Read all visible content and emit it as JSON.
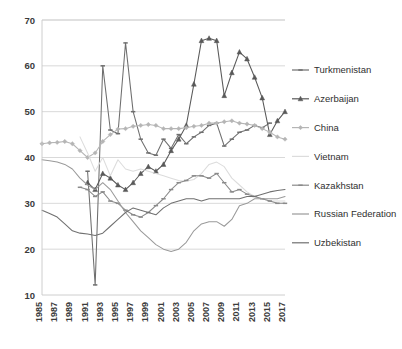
{
  "chart_data": {
    "type": "line",
    "title": "",
    "xlabel": "",
    "ylabel": "",
    "grid": true,
    "legend_position": "right",
    "xlim": [
      1985,
      2017
    ],
    "ylim": [
      10,
      70
    ],
    "y_ticks": [
      10,
      20,
      30,
      40,
      50,
      60,
      70
    ],
    "x_ticks": [
      1985,
      1987,
      1989,
      1991,
      1993,
      1995,
      1997,
      1999,
      2001,
      2003,
      2005,
      2007,
      2009,
      2011,
      2013,
      2015,
      2017
    ],
    "x": [
      1985,
      1986,
      1987,
      1988,
      1989,
      1990,
      1991,
      1992,
      1993,
      1994,
      1995,
      1996,
      1997,
      1998,
      1999,
      2000,
      2001,
      2002,
      2003,
      2004,
      2005,
      2006,
      2007,
      2008,
      2009,
      2010,
      2011,
      2012,
      2013,
      2014,
      2015,
      2016,
      2017
    ],
    "series": [
      {
        "name": "Turkmenistan",
        "color": "#6e6e6e",
        "marker": "dash",
        "values": [
          null,
          null,
          null,
          null,
          null,
          null,
          37.0,
          12.2,
          60.0,
          46.0,
          45.2,
          65.0,
          50.0,
          44.0,
          41.0,
          40.5,
          44.0,
          42.0,
          45.0,
          43.0,
          44.5,
          45.5,
          47.0,
          47.5,
          42.5,
          44.0,
          45.5,
          46.0,
          47.0,
          46.5,
          47.5,
          null,
          null
        ]
      },
      {
        "name": "Azerbaijan",
        "color": "#595959",
        "marker": "triangle",
        "values": [
          null,
          null,
          null,
          null,
          null,
          null,
          34.5,
          33.0,
          36.5,
          35.5,
          34.0,
          33.0,
          34.5,
          36.5,
          38.0,
          37.0,
          38.5,
          41.5,
          44.0,
          47.0,
          56.0,
          65.5,
          66.0,
          65.5,
          53.5,
          58.5,
          63.0,
          61.5,
          57.5,
          53.0,
          45.0,
          48.0,
          50.0
        ]
      },
      {
        "name": "China",
        "color": "#b5b5b5",
        "marker": "diamond",
        "values": [
          43.0,
          43.2,
          43.3,
          43.5,
          43.0,
          41.5,
          40.0,
          41.0,
          43.5,
          45.0,
          46.2,
          46.3,
          46.8,
          47.0,
          47.2,
          47.0,
          46.3,
          46.3,
          46.3,
          46.5,
          46.8,
          47.0,
          47.5,
          47.5,
          47.8,
          48.0,
          47.5,
          47.3,
          47.0,
          46.3,
          45.5,
          44.5,
          44.0
        ]
      },
      {
        "name": "Vietnam",
        "color": "#dcdcdc",
        "marker": "none",
        "values": [
          null,
          null,
          null,
          null,
          null,
          44.5,
          41.0,
          37.0,
          40.0,
          36.0,
          39.5,
          37.5,
          37.0,
          37.5,
          37.0,
          36.5,
          36.0,
          35.5,
          35.0,
          34.8,
          35.2,
          36.5,
          38.5,
          39.0,
          38.0,
          35.5,
          34.0,
          32.5,
          31.5,
          31.0,
          30.5,
          30.5,
          30.5
        ]
      },
      {
        "name": "Kazakhstan",
        "color": "#8a8a8a",
        "marker": "dash",
        "values": [
          null,
          null,
          null,
          null,
          null,
          33.5,
          33.0,
          31.5,
          32.5,
          30.5,
          30.0,
          28.5,
          27.5,
          27.0,
          28.0,
          29.5,
          31.0,
          33.0,
          34.5,
          35.0,
          36.0,
          36.0,
          35.5,
          36.5,
          34.5,
          32.5,
          33.0,
          32.0,
          31.5,
          31.0,
          30.5,
          30.0,
          30.0
        ]
      },
      {
        "name": "Russian Federation",
        "color": "#9a9a9a",
        "marker": "none",
        "values": [
          39.5,
          39.3,
          39.0,
          38.5,
          37.5,
          35.5,
          34.0,
          33.0,
          34.5,
          33.0,
          30.5,
          28.0,
          26.0,
          24.0,
          22.5,
          21.0,
          20.0,
          19.5,
          20.0,
          21.5,
          24.0,
          25.5,
          26.0,
          26.0,
          25.0,
          26.5,
          29.5,
          30.0,
          31.0,
          31.0,
          31.0,
          31.0,
          31.5
        ]
      },
      {
        "name": "Uzbekistan",
        "color": "#707070",
        "marker": "none",
        "values": [
          28.5,
          27.8,
          27.0,
          25.5,
          24.0,
          23.5,
          23.3,
          23.0,
          23.5,
          25.0,
          26.5,
          28.0,
          29.0,
          28.5,
          28.0,
          27.5,
          29.0,
          30.0,
          30.5,
          31.0,
          31.0,
          30.5,
          31.0,
          31.0,
          31.0,
          31.0,
          31.0,
          31.5,
          31.5,
          32.0,
          32.5,
          32.8,
          33.0
        ]
      }
    ],
    "legend_entries": [
      {
        "label": "Turkmenistan",
        "color": "#6e6e6e",
        "marker": "dash"
      },
      {
        "label": "Azerbaijan",
        "color": "#595959",
        "marker": "triangle"
      },
      {
        "label": "China",
        "color": "#b5b5b5",
        "marker": "diamond"
      },
      {
        "label": "Vietnam",
        "color": "#dcdcdc",
        "marker": "none"
      },
      {
        "label": "Kazakhstan",
        "color": "#8a8a8a",
        "marker": "dash"
      },
      {
        "label": "Russian Federation",
        "color": "#9a9a9a",
        "marker": "none"
      },
      {
        "label": "Uzbekistan",
        "color": "#707070",
        "marker": "none"
      }
    ]
  }
}
